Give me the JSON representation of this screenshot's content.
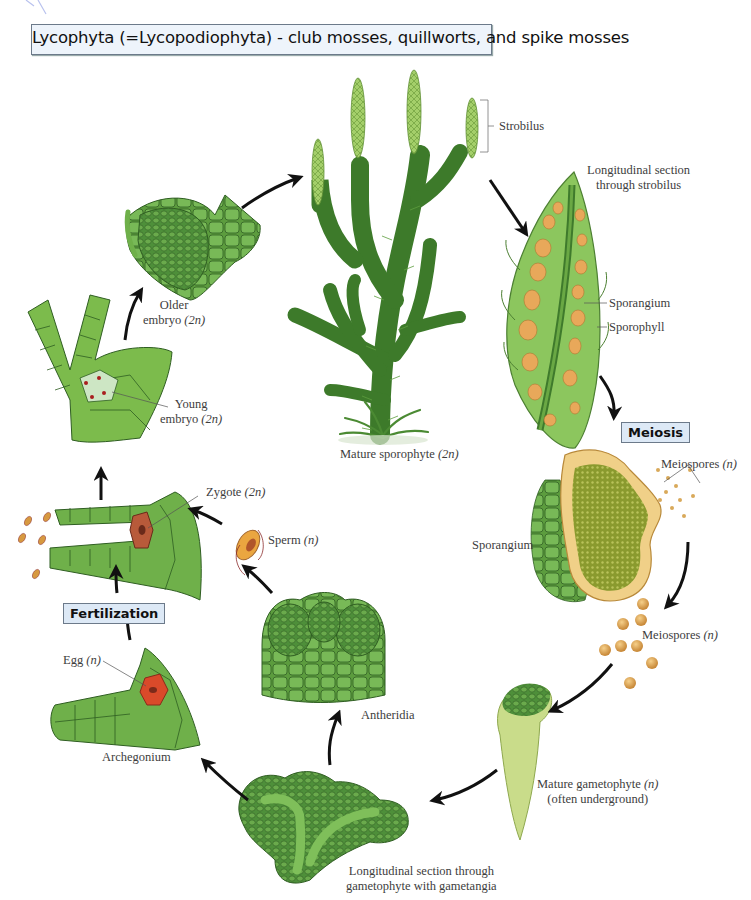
{
  "title": "Lycophyta (=Lycopodiophyta) - club mosses, quillworts, and spike mosses",
  "stages": {
    "meiosis": "Meiosis",
    "fertilization": "Fertilization"
  },
  "labels": {
    "strobilus": "Strobilus",
    "long_section_strobilus_1": "Longitudinal section",
    "long_section_strobilus_2": "through strobilus",
    "sporangium_strobilus": "Sporangium",
    "sporophyll": "Sporophyll",
    "mature_sporophyte": "Mature sporophyte",
    "mature_sporophyte_ploidy": "(2n)",
    "meiospores_top": "Meiospores",
    "meiospores_top_ploidy": "(n)",
    "sporangium": "Sporangium",
    "meiospores_bottom": "Meiospores",
    "meiospores_bottom_ploidy": "(n)",
    "mature_gametophyte": "Mature gametophyte",
    "mature_gametophyte_ploidy": "(n)",
    "often_underground": "(often underground)",
    "long_section_gametophyte_1": "Longitudinal section through",
    "long_section_gametophyte_2": "gametophyte with gametangia",
    "antheridia": "Antheridia",
    "archegonium": "Archegonium",
    "egg": "Egg",
    "egg_ploidy": "(n)",
    "sperm": "Sperm",
    "sperm_ploidy": "(n)",
    "zygote": "Zygote",
    "zygote_ploidy": "(2n)",
    "young_embryo_1": "Young",
    "young_embryo_2": "embryo",
    "young_embryo_ploidy": "(2n)",
    "older_embryo_1": "Older",
    "older_embryo_2": "embryo",
    "older_embryo_ploidy": "(2n)"
  },
  "colors": {
    "title_box_bg": "#eef4fb",
    "stage_box_bg": "#dde9f6",
    "plant_green": "#3f7a2c",
    "light_green": "#7cbb4c",
    "spore_orange": "#e8a85a",
    "egg_red": "#d24a2a",
    "arrow": "#111111"
  }
}
